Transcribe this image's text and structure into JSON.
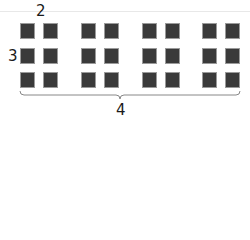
{
  "diagram": {
    "labels": {
      "columns_per_group": "2",
      "rows": "3",
      "groups": "4"
    },
    "grid": {
      "rows": 3,
      "groups": 4,
      "columns_per_group": 2
    },
    "colors": {
      "square": "#3a3a3a",
      "square_border": "#9a9a9a",
      "brace": "#888888",
      "text": "#1a1a1a"
    }
  }
}
